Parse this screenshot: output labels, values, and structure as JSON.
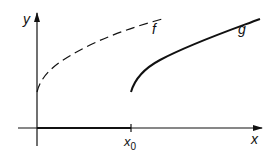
{
  "diagram": {
    "axes": {
      "x_label": "x",
      "y_label": "y"
    },
    "tick": {
      "label_main": "x",
      "label_sub": "0"
    },
    "curves": [
      {
        "name": "f",
        "style": "dashed"
      },
      {
        "name": "g",
        "style": "solid"
      }
    ]
  }
}
